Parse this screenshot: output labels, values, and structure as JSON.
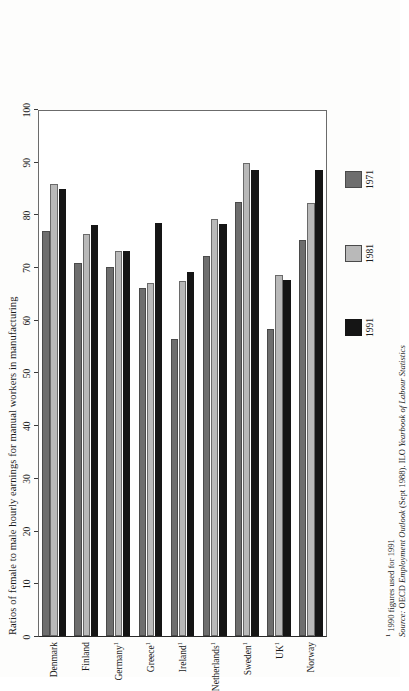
{
  "chart_data": {
    "type": "bar",
    "title": "",
    "xlabel": "",
    "ylabel": "Ratios of female to male hourly earnings for manual workers in manufacturing",
    "ylim": [
      0,
      100
    ],
    "yticks": [
      0,
      10,
      20,
      30,
      40,
      50,
      60,
      70,
      80,
      90,
      100
    ],
    "grid": false,
    "orientation": "vertical-bars-rotated-page",
    "legend_position": "right",
    "categories": [
      "Denmark",
      "Finland",
      "Germany",
      "Greece",
      "Ireland",
      "Netherlands",
      "Sweden",
      "UK",
      "Norway"
    ],
    "category_footnote_marks": [
      "",
      "",
      "1",
      "1",
      "1",
      "1",
      "1",
      "1",
      ""
    ],
    "series": [
      {
        "name": "1971",
        "color": "#6e6e6e",
        "values": [
          76.8,
          70.8,
          70.0,
          66.0,
          56.4,
          72.2,
          82.3,
          58.3,
          75.1
        ]
      },
      {
        "name": "1981",
        "color": "#b9b9b9",
        "values": [
          85.8,
          76.2,
          73.1,
          67.0,
          67.4,
          79.2,
          89.8,
          68.5,
          82.2
        ]
      },
      {
        "name": "1991",
        "color": "#151515",
        "values": [
          84.8,
          78.0,
          73.1,
          78.4,
          69.0,
          78.1,
          88.5,
          67.6,
          88.5
        ]
      }
    ]
  },
  "notes": {
    "footnote_mark": "1",
    "footnote_text": " 1990 figures used for 1991",
    "source_label": "Source:",
    "source_text_a": " OECD ",
    "source_italic_a": "Employment Outlook",
    "source_text_b": " (Sept 1988). ILO ",
    "source_italic_b": "Yearbook of Labour Statistics"
  }
}
